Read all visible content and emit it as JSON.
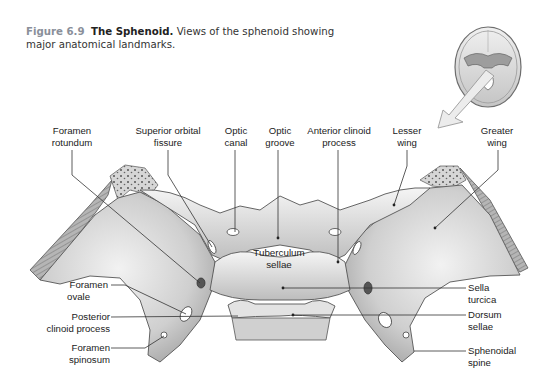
{
  "caption": {
    "figure_number": "Figure 6.9",
    "title": "The Sphenoid.",
    "text": "Views of the sphenoid showing major anatomical landmarks."
  },
  "colors": {
    "figure_number": "#8a8f9a",
    "bone_light": "#eeeeee",
    "bone_mid": "#c9c9c9",
    "bone_dark": "#8c8c8c",
    "leader_line": "#333333",
    "arrow_fill": "#e8e8e8"
  },
  "inset": {
    "description": "Superior view of skull floor with arrow indicating view direction"
  },
  "labels": {
    "foramen_rotundum": [
      "Foramen",
      "rotundum"
    ],
    "superior_orbital_fissure": [
      "Superior orbital",
      "fissure"
    ],
    "optic_canal": [
      "Optic",
      "canal"
    ],
    "optic_groove": [
      "Optic",
      "groove"
    ],
    "anterior_clinoid_process": [
      "Anterior clinoid",
      "process"
    ],
    "lesser_wing": [
      "Lesser",
      "wing"
    ],
    "greater_wing": [
      "Greater",
      "wing"
    ],
    "tuberculum_sellae": [
      "Tuberculum",
      "sellae"
    ],
    "foramen_ovale": [
      "Foramen",
      "ovale"
    ],
    "posterior_clinoid_process": [
      "Posterior",
      "clinoid process"
    ],
    "foramen_spinosum": [
      "Foramen",
      "spinosum"
    ],
    "sella_turcica": [
      "Sella",
      "turcica"
    ],
    "dorsum_sellae": [
      "Dorsum",
      "sellae"
    ],
    "sphenoidal_spine": [
      "Sphenoidal",
      "spine"
    ]
  }
}
